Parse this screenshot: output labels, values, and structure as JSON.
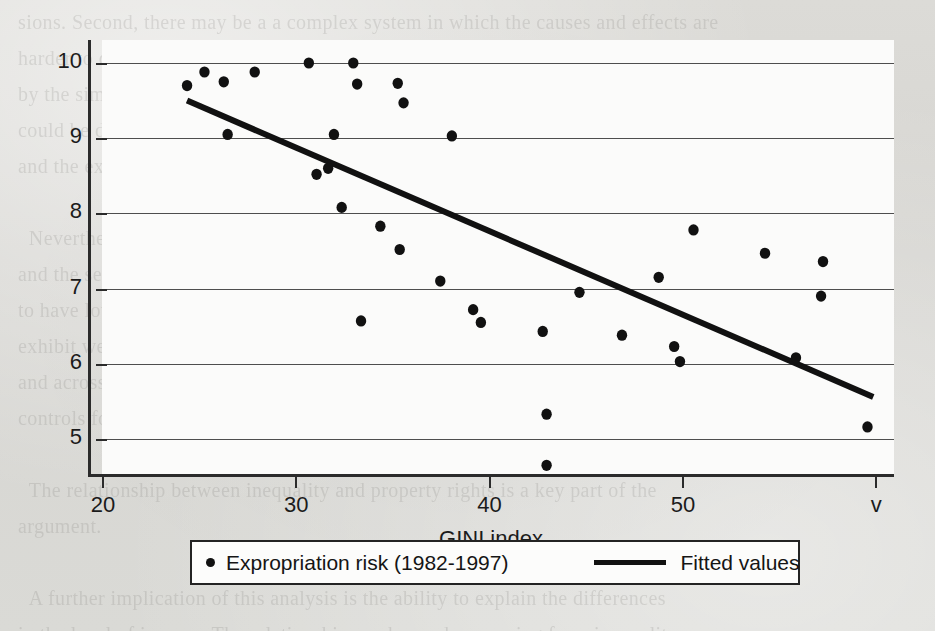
{
  "page": {
    "background_color": "#d9d8d4",
    "ghost_text": "sions. Second, there may be a a complex system in which the causes and effects are\nharder to discern, so the relationship may not be causal at all in the way implied\nby the simple correlation reported here. Third, the sample is small and the result\ncould be driven by outliers. Fourth, the measure of inequality may be imperfect,\nand the expropriation risk index may capture other institutional features.\n\n  Nevertheless, the figure shows a clear negative association between inequality\nand the security of property rights. Countries with higher GINI coefficients tend\nto have lower scores on the expropriation risk index, which is to say that they\nexhibit weaker protection of private property. This pattern holds across regions\nand across time periods within the sample, and it is robust to the inclusion of\ncontrols for income per capita.\n\n  The relationship between inequality and property rights is a key part of the\nargument.\n\n  A further implication of this analysis is the ability to explain the differences\nin the level of income. The relationship can be read as running from inequality\nto institutions, which in turn shape economic growth. This is the central prediction\nof the theory set out in the preceding sections, and it has a natural substantiation\nin the data. There is no evidence that the observed pattern is due to reverse causation."
  },
  "chart_data": {
    "type": "scatter",
    "title": "",
    "xlabel": "GINI index",
    "ylabel": "",
    "xlim": [
      20,
      60
    ],
    "ylim": [
      4.55,
      10.15
    ],
    "xticks": [
      20,
      30,
      40,
      50,
      60
    ],
    "xtick_labels": [
      "20",
      "30",
      "40",
      "50",
      "v"
    ],
    "yticks": [
      5,
      6,
      7,
      8,
      9,
      10
    ],
    "ytick_labels": [
      "5",
      "6",
      "7",
      "8",
      "9",
      "10"
    ],
    "grid": "horizontal",
    "legend_position": "below-axes",
    "series": [
      {
        "name": "Expropriation risk (1982-1997)",
        "type": "scatter",
        "marker": "circle",
        "color": "#111111",
        "points": [
          [
            24.4,
            9.7
          ],
          [
            25.3,
            9.88
          ],
          [
            26.3,
            9.75
          ],
          [
            26.5,
            9.05
          ],
          [
            27.9,
            9.88
          ],
          [
            30.7,
            10.0
          ],
          [
            31.1,
            8.52
          ],
          [
            31.7,
            8.6
          ],
          [
            32.0,
            9.05
          ],
          [
            32.4,
            8.08
          ],
          [
            33.0,
            10.0
          ],
          [
            33.2,
            9.72
          ],
          [
            33.4,
            6.57
          ],
          [
            34.4,
            7.83
          ],
          [
            35.3,
            9.73
          ],
          [
            35.4,
            7.52
          ],
          [
            35.6,
            9.47
          ],
          [
            37.5,
            7.1
          ],
          [
            38.1,
            9.03
          ],
          [
            39.2,
            6.72
          ],
          [
            39.6,
            6.55
          ],
          [
            42.8,
            6.43
          ],
          [
            43.0,
            5.33
          ],
          [
            43.0,
            4.65
          ],
          [
            44.7,
            6.95
          ],
          [
            46.9,
            6.38
          ],
          [
            48.8,
            7.15
          ],
          [
            49.6,
            6.23
          ],
          [
            49.9,
            6.03
          ],
          [
            50.6,
            7.78
          ],
          [
            54.3,
            7.47
          ],
          [
            55.9,
            6.08
          ],
          [
            57.3,
            7.36
          ],
          [
            57.2,
            6.9
          ],
          [
            59.6,
            5.16
          ]
        ]
      },
      {
        "name": "Fitted values",
        "type": "line",
        "color": "#111111",
        "endpoints": [
          [
            24.4,
            9.5
          ],
          [
            59.9,
            5.56
          ]
        ]
      }
    ]
  },
  "legend": {
    "entries": [
      {
        "label": "Expropriation risk (1982-1997)",
        "marker": "circle"
      },
      {
        "label": "Fitted values",
        "marker": "line"
      }
    ]
  }
}
